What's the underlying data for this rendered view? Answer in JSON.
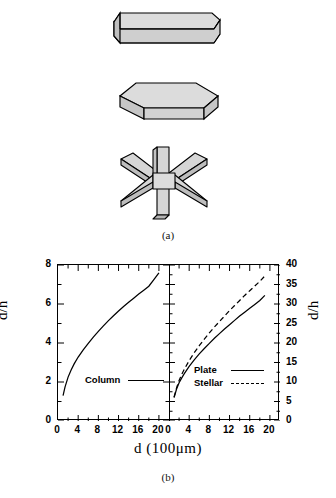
{
  "figure": {
    "panel_a_label": "(a)",
    "panel_b_label": "(b)",
    "crystals": [
      {
        "name": "hexagonal-column",
        "fill": "#d4d4d4",
        "stroke": "#000000"
      },
      {
        "name": "hexagonal-plate",
        "fill": "#d4d4d4",
        "stroke": "#000000"
      },
      {
        "name": "stellar-dendrite",
        "fill": "#d4d4d4",
        "stroke": "#000000"
      }
    ]
  },
  "chart_data": [
    {
      "type": "line",
      "panel": "left",
      "title": "",
      "xlabel": "d   (100μm)",
      "ylabel": "d/h",
      "xlim": [
        0,
        22
      ],
      "ylim": [
        0,
        8
      ],
      "xticks": [
        0,
        4,
        8,
        12,
        16,
        20
      ],
      "xminor_step": 2,
      "yticks": [
        0,
        2,
        4,
        6,
        8
      ],
      "yminor_step": 1,
      "grid": false,
      "legend_position": "lower-center",
      "series": [
        {
          "name": "Column",
          "style": "solid",
          "x": [
            1.0,
            1.4,
            2.0,
            2.6,
            3.2,
            4.0,
            5.0,
            6.0,
            7.0,
            8.0,
            9.0,
            10.0,
            11.0,
            12.0,
            13.0,
            14.0,
            15.0,
            16.0,
            17.0,
            18.0,
            19.0,
            20.0
          ],
          "values": [
            1.3,
            1.75,
            2.25,
            2.62,
            2.93,
            3.28,
            3.65,
            3.98,
            4.3,
            4.6,
            4.88,
            5.15,
            5.4,
            5.64,
            5.87,
            6.09,
            6.3,
            6.51,
            6.71,
            6.91,
            7.25,
            7.6
          ]
        }
      ]
    },
    {
      "type": "line",
      "panel": "right",
      "title": "",
      "xlabel": "d   (100μm)",
      "ylabel": "d/h",
      "xlim": [
        0,
        22
      ],
      "ylim": [
        0,
        40
      ],
      "xticks": [
        0,
        4,
        8,
        12,
        16,
        20
      ],
      "xminor_step": 2,
      "yticks": [
        0,
        5,
        10,
        15,
        20,
        25,
        30,
        35,
        40
      ],
      "yminor_step": 2.5,
      "grid": false,
      "legend_position": "lower-center",
      "series": [
        {
          "name": "Plate",
          "style": "solid",
          "x": [
            1.0,
            1.5,
            2.0,
            2.5,
            3.0,
            4.0,
            5.0,
            6.0,
            7.0,
            8.0,
            9.0,
            10.0,
            11.0,
            12.0,
            13.0,
            14.0,
            15.0,
            16.0,
            17.0,
            18.0,
            19.0
          ],
          "values": [
            6.0,
            8.2,
            9.8,
            11.0,
            12.1,
            14.0,
            15.7,
            17.2,
            18.6,
            19.9,
            21.2,
            22.4,
            23.6,
            24.7,
            25.8,
            26.9,
            27.9,
            28.9,
            29.9,
            30.9,
            32.2
          ]
        },
        {
          "name": "Stellar",
          "style": "dashed",
          "x": [
            1.0,
            1.5,
            2.0,
            2.5,
            3.0,
            4.0,
            5.0,
            6.0,
            7.0,
            8.0,
            9.0,
            10.0,
            11.0,
            12.0,
            13.0,
            14.0,
            15.0,
            16.0,
            17.0,
            18.0,
            19.0
          ],
          "values": [
            6.1,
            8.5,
            10.4,
            11.9,
            13.2,
            15.5,
            17.5,
            19.3,
            21.0,
            22.6,
            24.1,
            25.5,
            26.9,
            28.3,
            29.6,
            30.9,
            32.2,
            33.4,
            34.6,
            35.8,
            37.2
          ]
        }
      ]
    }
  ],
  "left_plot": {
    "yticks": [
      "0",
      "2",
      "4",
      "6",
      "8"
    ],
    "xticks": [
      "0",
      "4",
      "8",
      "12",
      "16",
      "20"
    ],
    "ylabel": "d/h",
    "legend": [
      {
        "label": "Column",
        "style": "solid"
      }
    ]
  },
  "right_plot": {
    "yticks": [
      "0",
      "5",
      "10",
      "15",
      "20",
      "25",
      "30",
      "35",
      "40"
    ],
    "xticks": [
      "0",
      "4",
      "8",
      "12",
      "16",
      "20"
    ],
    "ylabel": "d/h",
    "legend": [
      {
        "label": "Plate",
        "style": "solid"
      },
      {
        "label": "Stellar",
        "style": "dashed"
      }
    ]
  },
  "xaxis": {
    "title_symbol": "d",
    "title_units": "(100μm)",
    "title_full": "d   (100μm)"
  }
}
